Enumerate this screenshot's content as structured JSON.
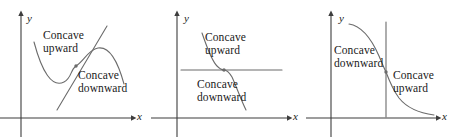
{
  "figure": {
    "width": 453,
    "height": 137,
    "background_color": "#ffffff",
    "curve_color": "#4a4a4a",
    "axis_color": "#3d3d3d",
    "text_color": "#1a1a1a"
  },
  "panels": [
    {
      "id": "panel-1",
      "name": "cubic-with-slanted-tangent",
      "axis_x_label": "x",
      "axis_y_label": "y",
      "labels": {
        "upper": {
          "line1": "Concave",
          "line2": "upward"
        },
        "lower": {
          "line1": "Concave",
          "line2": "downward"
        }
      },
      "tangent_orientation": "slanted",
      "inflection_point": {
        "x": 76,
        "y": 66
      }
    },
    {
      "id": "panel-2",
      "name": "decreasing-cubic-with-horizontal-tangent",
      "axis_x_label": "x",
      "axis_y_label": "y",
      "labels": {
        "upper": {
          "line1": "Concave",
          "line2": "upward"
        },
        "lower": {
          "line1": "Concave",
          "line2": "downward"
        }
      },
      "tangent_orientation": "horizontal",
      "inflection_point": {
        "x": 73,
        "y": 70
      }
    },
    {
      "id": "panel-3",
      "name": "decreasing-curve-with-vertical-tangent",
      "axis_x_label": "x",
      "axis_y_label": "y",
      "labels": {
        "upper": {
          "line1": "Concave",
          "line2": "downward"
        },
        "lower": {
          "line1": "Concave",
          "line2": "upward"
        }
      },
      "tangent_orientation": "vertical",
      "inflection_point": {
        "x": 80,
        "y": 72
      }
    }
  ]
}
